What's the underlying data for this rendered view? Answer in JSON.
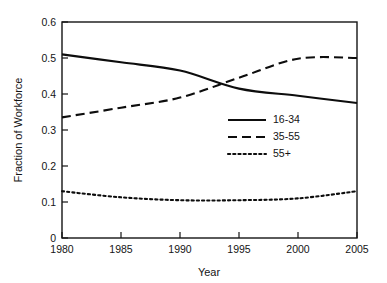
{
  "chart_data": {
    "type": "line",
    "title": "",
    "xlabel": "Year",
    "ylabel": "Fraction of Workforce",
    "xlim": [
      1980,
      2005
    ],
    "ylim": [
      0,
      0.6
    ],
    "xticks": [
      1980,
      1985,
      1990,
      1995,
      2000,
      2005
    ],
    "xticklabels": [
      "1980",
      "1985",
      "1990",
      "1995",
      "2000",
      "2005"
    ],
    "yticks": [
      0,
      0.1,
      0.2,
      0.3,
      0.4,
      0.5,
      0.6
    ],
    "yticklabels": [
      "0",
      "0.1",
      "0.2",
      "0.3",
      "0.4",
      "0.5",
      "0.6"
    ],
    "grid": false,
    "legend_position": "center-right-inside",
    "x": [
      1980,
      1985,
      1990,
      1995,
      2000,
      2005
    ],
    "series": [
      {
        "name": "16-34",
        "style": "solid",
        "color": "#0d0d0d",
        "values": [
          0.51,
          0.488,
          0.465,
          0.415,
          0.395,
          0.375
        ]
      },
      {
        "name": "35-55",
        "style": "dashed",
        "color": "#0d0d0d",
        "values": [
          0.335,
          0.362,
          0.39,
          0.445,
          0.498,
          0.5
        ]
      },
      {
        "name": "55+",
        "style": "dotted",
        "color": "#0d0d0d",
        "values": [
          0.13,
          0.113,
          0.105,
          0.105,
          0.11,
          0.13
        ]
      }
    ],
    "annotations": [
      {
        "text": "crossover of 16-34 and 35-55",
        "x": 1993,
        "y": 0.43
      }
    ]
  },
  "legend": {
    "entries": [
      {
        "label": "16-34",
        "style": "solid"
      },
      {
        "label": "35-55",
        "style": "dashed"
      },
      {
        "label": "55+",
        "style": "dotted"
      }
    ]
  },
  "axes": {
    "x_title": "Year",
    "y_title": "Fraction of Workforce"
  }
}
